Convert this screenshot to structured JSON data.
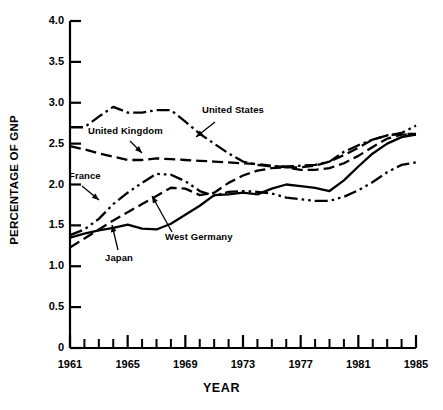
{
  "chart_data": {
    "type": "line",
    "title": "",
    "xlabel": "YEAR",
    "ylabel": "PERCENTAGE OF GNP",
    "xlim": [
      1961,
      1985
    ],
    "ylim": [
      0,
      4.0
    ],
    "grid": false,
    "legend_position": "inline-annotations",
    "ytick_labels": [
      "4.0",
      "3.5",
      "3.0",
      "2.5",
      "2.0",
      "1.5",
      "1.0",
      "0.5",
      "0"
    ],
    "ytick_values": [
      4.0,
      3.5,
      3.0,
      2.5,
      2.0,
      1.5,
      1.0,
      0.5,
      0
    ],
    "xtick_labels": [
      "1961",
      "1965",
      "1969",
      "1973",
      "1977",
      "1981",
      "1985"
    ],
    "xtick_values": [
      1961,
      1965,
      1969,
      1973,
      1977,
      1981,
      1985
    ],
    "xtick_minor_values": [
      1962,
      1963,
      1964,
      1966,
      1967,
      1968,
      1970,
      1971,
      1972,
      1974,
      1975,
      1976,
      1978,
      1979,
      1980,
      1982,
      1983,
      1984
    ],
    "x": [
      1961,
      1962,
      1963,
      1964,
      1965,
      1966,
      1967,
      1968,
      1969,
      1970,
      1971,
      1972,
      1973,
      1974,
      1975,
      1976,
      1977,
      1978,
      1979,
      1980,
      1981,
      1982,
      1983,
      1984,
      1985
    ],
    "series": [
      {
        "name": "United States",
        "line_style": "dash-dot",
        "color": "#000000",
        "values": [
          2.7,
          2.7,
          2.83,
          2.95,
          2.88,
          2.88,
          2.91,
          2.91,
          2.77,
          2.62,
          2.5,
          2.38,
          2.28,
          2.24,
          2.22,
          2.22,
          2.23,
          2.24,
          2.28,
          2.4,
          2.48,
          2.55,
          2.6,
          2.63,
          2.72
        ]
      },
      {
        "name": "United Kingdom",
        "line_style": "long-dash",
        "color": "#000000",
        "values": [
          2.47,
          2.43,
          2.38,
          2.34,
          2.3,
          2.3,
          2.32,
          2.31,
          2.3,
          2.29,
          2.28,
          2.27,
          2.26,
          2.25,
          2.23,
          2.21,
          2.18,
          2.18,
          2.2,
          2.26,
          2.35,
          2.46,
          2.56,
          2.61,
          2.61
        ]
      },
      {
        "name": "France",
        "line_style": "dash-dot-dot",
        "color": "#000000",
        "values": [
          1.38,
          1.45,
          1.58,
          1.76,
          1.9,
          2.02,
          2.13,
          2.12,
          2.04,
          1.92,
          1.86,
          1.91,
          1.92,
          1.91,
          1.89,
          1.84,
          1.82,
          1.8,
          1.8,
          1.85,
          1.93,
          2.03,
          2.15,
          2.24,
          2.27
        ]
      },
      {
        "name": "West Germany",
        "line_style": "long-dash",
        "color": "#000000",
        "values": [
          1.23,
          1.34,
          1.45,
          1.56,
          1.66,
          1.76,
          1.86,
          1.96,
          1.95,
          1.87,
          1.9,
          2.02,
          2.11,
          2.17,
          2.2,
          2.21,
          2.21,
          2.23,
          2.28,
          2.36,
          2.45,
          2.55,
          2.6,
          2.62,
          2.62
        ]
      },
      {
        "name": "Japan",
        "line_style": "solid",
        "color": "#000000",
        "values": [
          1.35,
          1.4,
          1.44,
          1.47,
          1.51,
          1.46,
          1.45,
          1.52,
          1.63,
          1.74,
          1.87,
          1.88,
          1.9,
          1.88,
          1.95,
          2.0,
          1.98,
          1.96,
          1.92,
          2.05,
          2.22,
          2.38,
          2.5,
          2.58,
          2.61
        ]
      }
    ],
    "annotations": [
      {
        "text": "United States",
        "x": 202,
        "y": 110,
        "arrow_from": [
          215,
          122
        ],
        "arrow_to": [
          196,
          137
        ]
      },
      {
        "text": "United Kingdom",
        "x": 88,
        "y": 131,
        "arrow_from": [
          130,
          141
        ],
        "arrow_to": [
          142,
          153
        ]
      },
      {
        "text": "France",
        "x": 69,
        "y": 176,
        "arrow_from": [
          82,
          186
        ],
        "arrow_to": [
          99,
          200
        ]
      },
      {
        "text": "West Germany",
        "x": 165,
        "y": 237,
        "arrow_from": [
          172,
          232
        ],
        "arrow_to": [
          152,
          196
        ]
      },
      {
        "text": "Japan",
        "x": 105,
        "y": 258,
        "arrow_from": [
          118,
          250
        ],
        "arrow_to": [
          112,
          225
        ]
      }
    ]
  },
  "axes": {
    "plot_left": 70,
    "plot_right": 416,
    "plot_top": 21,
    "plot_bottom": 348
  }
}
